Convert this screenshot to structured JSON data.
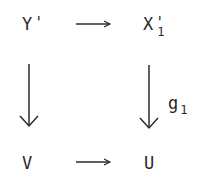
{
  "diagram": {
    "type": "commutative-square",
    "nodes": {
      "top_left": {
        "base": "Y",
        "prime": "'",
        "subscript": ""
      },
      "top_right": {
        "base": "X",
        "prime": "'",
        "subscript": "1"
      },
      "bottom_left": {
        "base": "V",
        "prime": "",
        "subscript": ""
      },
      "bottom_right": {
        "base": "U",
        "prime": "",
        "subscript": ""
      }
    },
    "arrows": [
      {
        "from": "Y'",
        "to": "X'1",
        "direction": "right",
        "label": ""
      },
      {
        "from": "Y'",
        "to": "V",
        "direction": "down",
        "label": ""
      },
      {
        "from": "X'1",
        "to": "U",
        "direction": "down",
        "label": "g1"
      },
      {
        "from": "V",
        "to": "U",
        "direction": "right",
        "label": ""
      }
    ],
    "labels": {
      "right_arrow": {
        "base": "g",
        "subscript": "1"
      }
    },
    "colors": {
      "ink": "#2a2a2a",
      "background": "#ffffff"
    }
  }
}
